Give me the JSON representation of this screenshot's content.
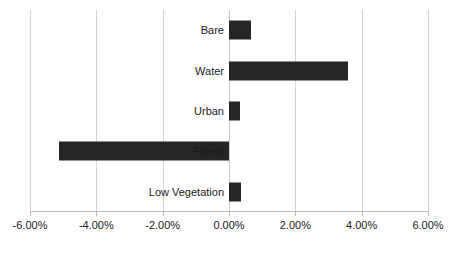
{
  "chart_data": {
    "type": "bar",
    "orientation": "horizontal",
    "title": "",
    "subtitle": "",
    "xlabel": "",
    "ylabel": "",
    "categories": [
      "Bare",
      "Water",
      "Urban",
      "Forest",
      "Low Vegetation"
    ],
    "values": [
      0.65,
      3.58,
      0.33,
      -5.14,
      0.36
    ],
    "value_format": "percent",
    "xlim": [
      -6.0,
      6.0
    ],
    "xticks": [
      -6.0,
      -4.0,
      -2.0,
      0.0,
      2.0,
      4.0,
      6.0
    ],
    "xtick_labels": [
      "-6.00%",
      "-4.00%",
      "-2.00%",
      "0.00%",
      "2.00%",
      "4.00%",
      "6.00%"
    ],
    "grid": "vertical",
    "legend": "none",
    "series": [
      {
        "name": "",
        "color": "#262626",
        "points": [
          {
            "category": "Bare",
            "value": 0.65,
            "label": "0.65%"
          },
          {
            "category": "Water",
            "value": 3.58,
            "label": "3.58%"
          },
          {
            "category": "Urban",
            "value": 0.33,
            "label": "0.33%"
          },
          {
            "category": "Forest",
            "value": -5.14,
            "label": "-5.14%"
          },
          {
            "category": "Low Vegetation",
            "value": 0.36,
            "label": "0.36%"
          }
        ]
      }
    ]
  },
  "axis": {
    "x": {
      "ticks": [
        {
          "value": -6.0,
          "label": "-6.00%"
        },
        {
          "value": -4.0,
          "label": "-4.00%"
        },
        {
          "value": -2.0,
          "label": "-2.00%"
        },
        {
          "value": 0.0,
          "label": "0.00%"
        },
        {
          "value": 2.0,
          "label": "2.00%"
        },
        {
          "value": 4.0,
          "label": "4.00%"
        },
        {
          "value": 6.0,
          "label": "6.00%"
        }
      ]
    },
    "y": {
      "categories": [
        {
          "label": "Bare"
        },
        {
          "label": "Water"
        },
        {
          "label": "Urban"
        },
        {
          "label": "Forest"
        },
        {
          "label": "Low Vegetation"
        }
      ]
    }
  },
  "style": {
    "bar_color": "#262626",
    "gridline_color": "#d4d4d4",
    "axis_color": "#b8b8b8",
    "background": "#ffffff",
    "text_color": "#1a1a1a"
  }
}
